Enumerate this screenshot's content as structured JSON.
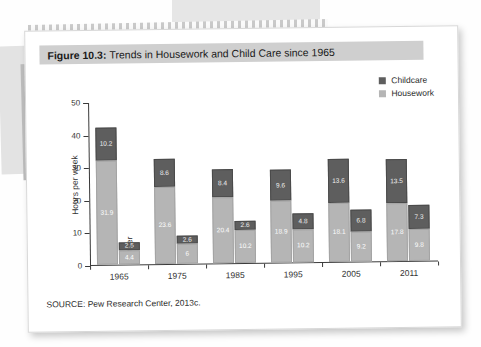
{
  "figure": {
    "number_label": "Figure 10.3:",
    "caption": "Trends in Housework and Child Care since 1965",
    "source": "SOURCE: Pew Research Center, 2013c."
  },
  "legend": {
    "items": [
      {
        "label": "Childcare",
        "color": "#5e5e5e"
      },
      {
        "label": "Housework",
        "color": "#b5b5b5"
      }
    ]
  },
  "roles": {
    "mother": "Mother",
    "father": "Father"
  },
  "chart_data": {
    "type": "bar",
    "stacked": true,
    "title": "Trends in Housework and Child Care since 1965",
    "xlabel": "",
    "ylabel": "Hours per week",
    "ylim": [
      0,
      50
    ],
    "yticks": [
      0,
      10,
      20,
      30,
      40,
      50
    ],
    "grid": false,
    "legend_position": "top-right",
    "categories": [
      "1965",
      "1975",
      "1985",
      "1995",
      "2005",
      "2011"
    ],
    "groups": [
      "Mother",
      "Father"
    ],
    "series": [
      {
        "name": "Housework",
        "color": "#b5b5b5",
        "mother": [
          31.9,
          23.6,
          20.4,
          18.9,
          18.1,
          17.8
        ],
        "father": [
          4.4,
          6,
          10.2,
          10.2,
          9.2,
          9.8
        ]
      },
      {
        "name": "Childcare",
        "color": "#5e5e5e",
        "mother": [
          10.2,
          8.6,
          8.4,
          9.6,
          13.6,
          13.5
        ],
        "father": [
          2.5,
          2.6,
          2.6,
          4.8,
          6.8,
          7.3
        ]
      }
    ],
    "bars": [
      {
        "category": "1965",
        "mother": {
          "housework": 31.9,
          "childcare": 10.2,
          "total": 42.1
        },
        "father": {
          "housework": 4.4,
          "childcare": 2.5,
          "total": 6.9
        }
      },
      {
        "category": "1975",
        "mother": {
          "housework": 23.6,
          "childcare": 8.6,
          "total": 32.2
        },
        "father": {
          "housework": 6,
          "childcare": 2.6,
          "total": 8.6
        }
      },
      {
        "category": "1985",
        "mother": {
          "housework": 20.4,
          "childcare": 8.4,
          "total": 28.8
        },
        "father": {
          "housework": 10.2,
          "childcare": 2.6,
          "total": 12.8
        }
      },
      {
        "category": "1995",
        "mother": {
          "housework": 18.9,
          "childcare": 9.6,
          "total": 28.5
        },
        "father": {
          "housework": 10.2,
          "childcare": 4.8,
          "total": 15.0
        }
      },
      {
        "category": "2005",
        "mother": {
          "housework": 18.1,
          "childcare": 13.6,
          "total": 31.7
        },
        "father": {
          "housework": 9.2,
          "childcare": 6.8,
          "total": 16.0
        }
      },
      {
        "category": "2011",
        "mother": {
          "housework": 17.8,
          "childcare": 13.5,
          "total": 31.3
        },
        "father": {
          "housework": 9.8,
          "childcare": 7.3,
          "total": 17.1
        }
      }
    ]
  }
}
